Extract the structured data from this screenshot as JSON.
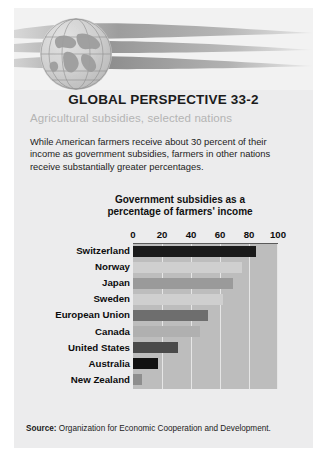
{
  "header": {
    "globe_icon": "globe-icon",
    "swoosh_icon": "swoosh-ribbon-graphic"
  },
  "title": "GLOBAL PERSPECTIVE 33-2",
  "subtitle": "Agricultural subsidies, selected nations",
  "intro": "While American farmers receive about 30 percent of their income as government subsidies, farmers in other nations receive substantially greater percentages.",
  "source_label": "Source:",
  "source_text": "Organization for Economic Cooperation and Development.",
  "colors": {
    "paper": "#ececed",
    "plot_background": "#bdbdbd",
    "gridline": "#e6e6e6",
    "bar_dark": "#1a1a1a",
    "bar_mid": "#6e6e6e",
    "bar_light": "#c9c9c9",
    "subtitle": "#b4b4b4"
  },
  "chart_data": {
    "type": "bar",
    "orientation": "horizontal",
    "title": "Government subsidies as a percentage of farmers' income",
    "title_line1": "Government subsidies as a",
    "title_line2": "percentage of farmers' income",
    "xlabel": "",
    "ylabel": "",
    "xlim": [
      0,
      100
    ],
    "ticks": [
      0,
      20,
      40,
      60,
      80,
      100
    ],
    "tick_labels": [
      "0",
      "20",
      "40",
      "60",
      "80",
      "100"
    ],
    "grid": true,
    "legend": "none",
    "categories": [
      "Switzerland",
      "Norway",
      "Japan",
      "Sweden",
      "European Union",
      "Canada",
      "United States",
      "Australia",
      "New Zealand"
    ],
    "values": [
      85,
      75,
      69,
      62,
      52,
      46,
      31,
      17,
      6
    ],
    "bar_shades": [
      "#1a1a1a",
      "#cfcfcf",
      "#9a9a9a",
      "#cfcfcf",
      "#6e6e6e",
      "#b0b0b0",
      "#4a4a4a",
      "#111111",
      "#8e8e8e"
    ]
  }
}
